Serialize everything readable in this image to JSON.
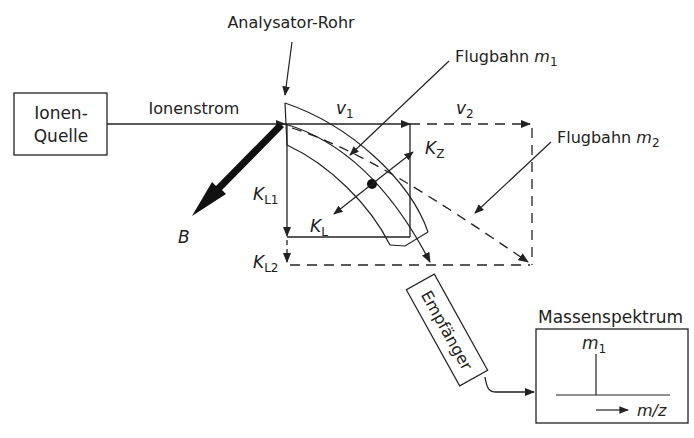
{
  "labels": {
    "analyzer_tube": "Analysator-Rohr",
    "ion_source_line1": "Ionen-",
    "ion_source_line2": "Quelle",
    "ion_stream": "Ionenstrom",
    "trajectory_m1_prefix": "Flugbahn ",
    "trajectory_m2_prefix": "Flugbahn ",
    "mass_var": "m",
    "sub_1": "1",
    "sub_2": "2",
    "v_var": "v",
    "k_var": "K",
    "k_z_sub": "Z",
    "k_l_sub": "L",
    "k_l1_sub": "L1",
    "k_l2_sub": "L2",
    "b_field": "B",
    "receiver": "Empfänger",
    "mass_spectrum": "Massenspektrum",
    "mz_axis": "m/z"
  },
  "colors": {
    "stroke": "#222222",
    "background": "#ffffff"
  }
}
